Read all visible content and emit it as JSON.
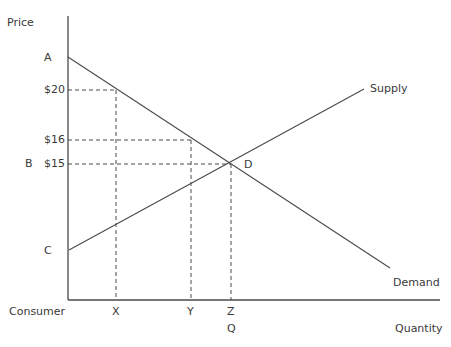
{
  "diagram": {
    "axes": {
      "y_label": "Price",
      "x_label": "Quantity",
      "x_origin_label": "Consumer"
    },
    "price_labels": {
      "A": "A",
      "p20": "$20",
      "p16": "$16",
      "B": "B",
      "p15": "$15",
      "C": "C"
    },
    "quantity_labels": {
      "X": "X",
      "Y": "Y",
      "Z": "Z",
      "Q": "Q"
    },
    "curves": {
      "supply": "Supply",
      "demand": "Demand"
    },
    "equilibrium_label": "D",
    "colors": {
      "line": "#4a4a4a",
      "text": "#3a3a3a"
    }
  }
}
